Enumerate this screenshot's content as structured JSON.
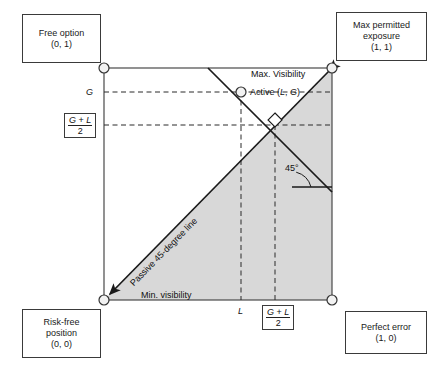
{
  "figure": {
    "type": "diagram",
    "square": {
      "x0": 104,
      "y0": 68,
      "x1": 332,
      "y1": 300
    }
  },
  "corner_boxes": [
    {
      "name": "free-option",
      "line1": "Free option",
      "line2": "(0, 1)",
      "x": 22,
      "y": 14,
      "w": 79,
      "h": 49
    },
    {
      "name": "max-permitted",
      "line1": "Max permitted",
      "line2": "exposure",
      "line3": "(1, 1)",
      "x": 336,
      "y": 12,
      "w": 91,
      "h": 49
    },
    {
      "name": "risk-free-position",
      "line1": "Risk-free",
      "line2": "position",
      "line3": "(0, 0)",
      "x": 22,
      "y": 309,
      "w": 79,
      "h": 49
    },
    {
      "name": "perfect-error",
      "line1": "Perfect error",
      "line2": "(1, 0)",
      "x": 345,
      "y": 311,
      "w": 82,
      "h": 43
    }
  ],
  "axis_labels": {
    "g": "G",
    "l": "L",
    "fraction_numerator_g": "G",
    "fraction_numerator_plus": " + ",
    "fraction_numerator_l": "L",
    "fraction_denominator": "2"
  },
  "annotations": {
    "max_visibility": "Max. Visibility",
    "min_visibility": "Min. visibility",
    "active_point": "Active (L, G)",
    "active_point_prefix": "Active (",
    "active_point_l": "L",
    "active_point_comma": ", ",
    "active_point_g": "G",
    "active_point_suffix": ")",
    "passive_line": "Passive 45-degree line",
    "angle": "45°"
  },
  "geometry": {
    "corner_points": [
      {
        "name": "top-left",
        "cx": 104,
        "cy": 68,
        "r": 5
      },
      {
        "name": "top-right",
        "cx": 332,
        "cy": 68,
        "r": 5
      },
      {
        "name": "bottom-left",
        "cx": 104,
        "cy": 300,
        "r": 5
      },
      {
        "name": "bottom-right",
        "cx": 332,
        "cy": 300,
        "r": 5
      }
    ],
    "active_marker": {
      "cx": 241,
      "cy": 92,
      "r": 5
    },
    "midpoint": {
      "x": 275,
      "y": 125
    },
    "l_gridline_x": 241,
    "mid_gridline_x": 275,
    "g_gridline_y": 92,
    "mid_gridline_y": 125,
    "descending_line": {
      "x1": 208,
      "y1": 68,
      "x2": 332,
      "y2": 192
    },
    "diagonal_line": {
      "x1": 104,
      "y1": 300,
      "x2": 332,
      "y2": 68
    },
    "angle_arm_y": 187,
    "angle_arm_x1": 292,
    "angle_arm_x2": 332
  },
  "colors": {
    "shade_fill": "#d8d8d8",
    "line": "#1a1a1a",
    "box_border": "#3a3a3a",
    "square_border": "#4a4a4a",
    "dash": "#2a2a2a",
    "background": "#ffffff"
  }
}
